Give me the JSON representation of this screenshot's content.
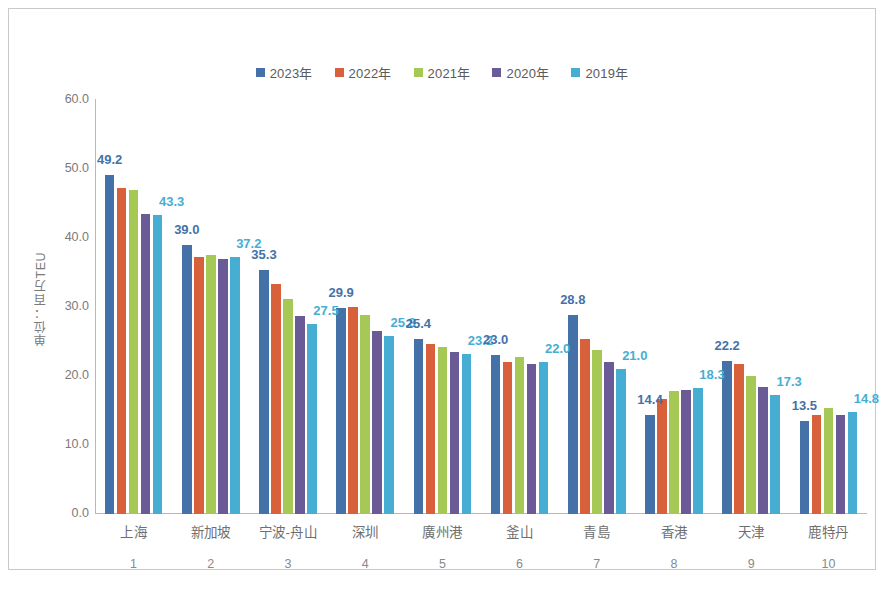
{
  "chart_data": {
    "type": "bar",
    "title": "",
    "xlabel": "",
    "ylabel": "单位：百万TEU",
    "ylim": [
      0.0,
      60.0
    ],
    "ytick_labels": [
      "60.0",
      "50.0",
      "40.0",
      "30.0",
      "20.0",
      "10.0",
      "0.0"
    ],
    "ytick_values": [
      60.0,
      50.0,
      40.0,
      30.0,
      20.0,
      10.0,
      0.0
    ],
    "grid": false,
    "legend_position": "top-center",
    "categories": [
      "上海",
      "新加坡",
      "宁波-舟山",
      "深圳",
      "廣州港",
      "釜山",
      "青島",
      "香港",
      "天津",
      "鹿特丹"
    ],
    "ranks": [
      "1",
      "2",
      "3",
      "4",
      "5",
      "6",
      "7",
      "8",
      "9",
      "10"
    ],
    "series": [
      {
        "name": "2023年",
        "color": "#4472a8",
        "values": [
          49.2,
          39.0,
          35.3,
          29.9,
          25.4,
          23.0,
          28.8,
          14.4,
          22.2,
          13.5
        ],
        "labeled": true
      },
      {
        "name": "2022年",
        "color": "#d8613c",
        "values": [
          47.3,
          37.3,
          33.4,
          30.0,
          24.6,
          22.0,
          25.3,
          16.6,
          21.8,
          14.4
        ],
        "labeled": false
      },
      {
        "name": "2021年",
        "color": "#a5c954",
        "values": [
          47.0,
          37.5,
          31.1,
          28.8,
          24.2,
          22.7,
          23.7,
          17.8,
          20.0,
          15.3
        ],
        "labeled": false
      },
      {
        "name": "2020年",
        "color": "#6a5a96",
        "values": [
          43.5,
          36.9,
          28.7,
          26.5,
          23.5,
          21.8,
          22.0,
          18.0,
          18.4,
          14.3
        ],
        "labeled": false
      },
      {
        "name": "2019年",
        "color": "#45aed2",
        "values": [
          43.3,
          37.2,
          27.5,
          25.8,
          23.2,
          22.0,
          21.0,
          18.3,
          17.3,
          14.8
        ],
        "labeled": true
      }
    ],
    "data_labels": [
      {
        "group": 0,
        "series": 0,
        "text": "49.2"
      },
      {
        "group": 0,
        "series": 4,
        "text": "43.3"
      },
      {
        "group": 1,
        "series": 0,
        "text": "39.0"
      },
      {
        "group": 1,
        "series": 4,
        "text": "37.2"
      },
      {
        "group": 2,
        "series": 0,
        "text": "35.3"
      },
      {
        "group": 2,
        "series": 4,
        "text": "27.5"
      },
      {
        "group": 3,
        "series": 0,
        "text": "29.9"
      },
      {
        "group": 3,
        "series": 4,
        "text": "25.8"
      },
      {
        "group": 4,
        "series": 0,
        "text": "25.4"
      },
      {
        "group": 4,
        "series": 4,
        "text": "23.2"
      },
      {
        "group": 5,
        "series": 0,
        "text": "23.0"
      },
      {
        "group": 5,
        "series": 4,
        "text": "22.0"
      },
      {
        "group": 6,
        "series": 0,
        "text": "28.8"
      },
      {
        "group": 6,
        "series": 4,
        "text": "21.0"
      },
      {
        "group": 7,
        "series": 0,
        "text": "14.4"
      },
      {
        "group": 7,
        "series": 4,
        "text": "18.3"
      },
      {
        "group": 8,
        "series": 0,
        "text": "22.2"
      },
      {
        "group": 8,
        "series": 4,
        "text": "17.3"
      },
      {
        "group": 9,
        "series": 0,
        "text": "13.5"
      },
      {
        "group": 9,
        "series": 4,
        "text": "14.8"
      }
    ]
  }
}
